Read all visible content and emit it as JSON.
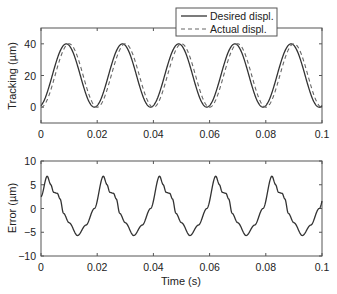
{
  "chart_data": [
    {
      "type": "line",
      "title": "",
      "xlabel": "",
      "ylabel": "Tracking (µm)",
      "xlim": [
        0,
        0.1
      ],
      "ylim": [
        -10,
        50
      ],
      "xticks": [
        "0",
        "0.02",
        "0.04",
        "0.06",
        "0.08",
        "0.1"
      ],
      "yticks": [
        "0",
        "20",
        "40"
      ],
      "grid": false,
      "legend": {
        "position": "top-right, overlapping top edge",
        "entries": [
          "Desired displ.",
          "Actual displ."
        ]
      },
      "series": [
        {
          "name": "Desired displ.",
          "style": "solid",
          "description": "sinusoid 20 + 20*sin(2*pi*50*t - 0.14*pi); period 0.02 s; peaks 40 at t≈0.009, 0.029, 0.049, 0.069, 0.089; minima 0 at t≈0.019, 0.039, 0.059, 0.079, 0.099",
          "x": [
            0,
            0.0025,
            0.005,
            0.0075,
            0.009,
            0.0115,
            0.014,
            0.0165,
            0.019,
            0.0215,
            0.024,
            0.0265,
            0.029
          ],
          "values": [
            3,
            12,
            24,
            35,
            40,
            36,
            24,
            10,
            0,
            5,
            17,
            30,
            40
          ]
        },
        {
          "name": "Actual displ.",
          "style": "dashed",
          "description": "same sinusoid lagging ≈0.001 s",
          "x": [
            0,
            0.0025,
            0.005,
            0.0075,
            0.01,
            0.0125,
            0.015,
            0.0175,
            0.02,
            0.0225,
            0.025,
            0.0275,
            0.03
          ],
          "values": [
            0,
            8,
            20,
            32,
            40,
            36,
            24,
            10,
            0,
            5,
            17,
            30,
            40
          ]
        }
      ]
    },
    {
      "type": "line",
      "title": "",
      "xlabel": "Time (s)",
      "ylabel": "Error (µm)",
      "xlim": [
        0,
        0.1
      ],
      "ylim": [
        -10,
        10
      ],
      "xticks": [
        "0",
        "0.02",
        "0.04",
        "0.06",
        "0.08",
        "0.1"
      ],
      "yticks": [
        "-10",
        "-5",
        "0",
        "5",
        "10"
      ],
      "grid": false,
      "series": [
        {
          "name": "Error",
          "style": "solid",
          "description": "periodic (0.02 s) error: peak ≈6.8 shortly after each period start, shoulder ≈3.2, trough ≈-5.7 at t≈0.013+k*0.02",
          "x": [
            0,
            0.0022,
            0.0035,
            0.0045,
            0.0058,
            0.0068,
            0.008,
            0.01,
            0.013,
            0.016,
            0.019,
            0.0222
          ],
          "values": [
            2.5,
            6.8,
            5.0,
            3.4,
            3.2,
            2.0,
            -1.0,
            -3.0,
            -5.7,
            -3.5,
            0.0,
            6.8
          ]
        }
      ]
    }
  ],
  "labels": {
    "top_ylabel": "Tracking (µm)",
    "bottom_ylabel": "Error (µm)",
    "xlabel": "Time (s)",
    "legend_desired": "Desired displ.",
    "legend_actual": "Actual displ.",
    "xticks": [
      "0",
      "0.02",
      "0.04",
      "0.06",
      "0.08",
      "0.1"
    ],
    "top_yticks": [
      "0",
      "20",
      "40"
    ],
    "bottom_yticks": [
      "−10",
      "−5",
      "0",
      "5",
      "10"
    ]
  },
  "colors": {
    "line": "#333333",
    "axis": "#555555"
  }
}
